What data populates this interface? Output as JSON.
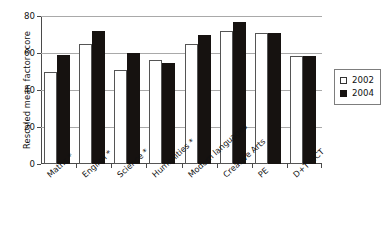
{
  "chart_data": {
    "type": "bar",
    "title": "",
    "xlabel": "",
    "ylabel": "Rescaled mean factor score",
    "ylim": [
      0,
      80
    ],
    "yticks": [
      0,
      20,
      40,
      60,
      80
    ],
    "grid": true,
    "legend_position": "right",
    "categories": [
      "Maths *",
      "English *",
      "Science *",
      "Humanities *",
      "Modern languages",
      "Creative Arts",
      "PE",
      "D+T+ICT"
    ],
    "series": [
      {
        "name": "2002",
        "color": "#ffffff",
        "values": [
          50,
          65,
          51,
          56,
          65,
          72,
          71,
          58.5
        ]
      },
      {
        "name": "2004",
        "color": "#161210",
        "values": [
          59,
          72,
          60,
          54.5,
          69.5,
          77,
          71,
          58.5
        ]
      }
    ]
  },
  "legend": {
    "items": [
      {
        "label": "2002"
      },
      {
        "label": "2004"
      }
    ]
  },
  "axis": {
    "y_title": "Rescaled mean factor score",
    "y_tick_labels": [
      "80",
      "60",
      "40",
      "20",
      "0"
    ]
  },
  "footnote": ""
}
